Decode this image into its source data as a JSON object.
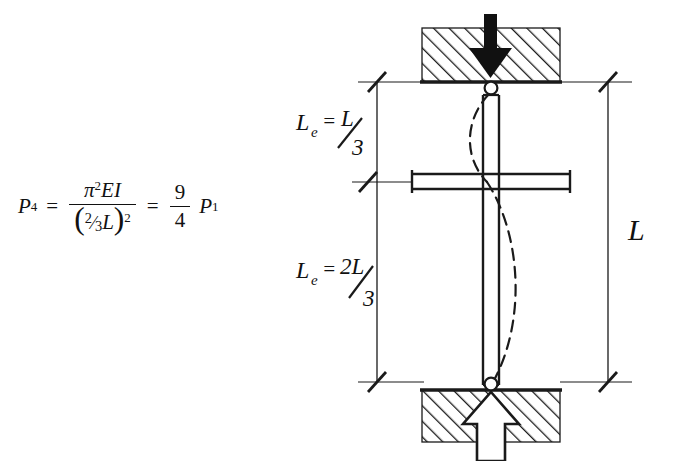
{
  "figure": {
    "type": "engineering-diagram"
  },
  "formula": {
    "lhs": "P",
    "lhs_sub": "4",
    "equals_1": "=",
    "numerator": {
      "pi": "π",
      "pi_exp": "2",
      "terms": "EI"
    },
    "denominator": {
      "open": "(",
      "frac_num": "2",
      "slash": "⁄",
      "frac_den": "3",
      "length": "L",
      "close": ")",
      "exp": "2"
    },
    "equals_2": "=",
    "result_frac": {
      "num": "9",
      "den": "4"
    },
    "rhs": "P",
    "rhs_sub": "1",
    "plain_text": "P4 = π²EI / (⅔L)² = 9/4 P1"
  },
  "diagram": {
    "labels": {
      "upper_segment": {
        "base": "L",
        "base_sub": "e",
        "equals": "=",
        "num": "L",
        "den": "3"
      },
      "lower_segment": {
        "base": "L",
        "base_sub": "e",
        "equals": "=",
        "num": "2L",
        "den": "3"
      },
      "total_length": "L"
    },
    "label_plain": {
      "upper_segment": "Le = L/3",
      "lower_segment": "Le = 2L/3",
      "total_length": "L"
    },
    "elements": {
      "top_support_name": "fixed-hatched-block-top",
      "bottom_support_name": "fixed-hatched-block-bottom",
      "load_arrow_top": "applied-load-arrow-down",
      "reaction_arrow_bottom": "reaction-arrow-up",
      "pin_top": "pin-connection-top",
      "pin_bottom": "pin-connection-bottom",
      "lateral_brace": "intermediate-lateral-support",
      "column": "column-member",
      "buckled_shape": "buckled-deflected-shape"
    },
    "colors": {
      "ink": "#1a1a1a",
      "paper": "#ffffff",
      "arrow_fill_solid": "#111111",
      "arrow_fill_hollow": "#ffffff"
    }
  }
}
